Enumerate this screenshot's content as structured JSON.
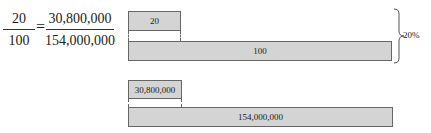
{
  "equation": {
    "left_fraction": {
      "numerator": "20",
      "denominator": "100"
    },
    "equals": "=",
    "right_fraction": {
      "numerator": "30,800,000",
      "denominator": "154,000,000"
    }
  },
  "diagram_top": {
    "part_bar": {
      "label": "20"
    },
    "whole_bar": {
      "label": "100"
    },
    "brace_label": "20%"
  },
  "diagram_bottom": {
    "part_bar": {
      "label": "30,800,000"
    },
    "whole_bar": {
      "label": "154,000,000"
    }
  },
  "colors": {
    "bar_fill": "#d4d4d4",
    "bar_border": "#666666"
  }
}
